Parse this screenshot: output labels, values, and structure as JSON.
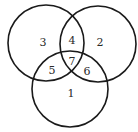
{
  "diagram": {
    "type": "venn",
    "circles": [
      {
        "id": "left",
        "cx": 46,
        "cy": 43,
        "r": 38
      },
      {
        "id": "right",
        "cx": 98,
        "cy": 44,
        "r": 38
      },
      {
        "id": "bottom",
        "cx": 70,
        "cy": 89,
        "r": 38
      }
    ],
    "regions": [
      {
        "label": "1",
        "x": 71,
        "y": 93
      },
      {
        "label": "2",
        "x": 100,
        "y": 42
      },
      {
        "label": "3",
        "x": 43,
        "y": 42
      },
      {
        "label": "4",
        "x": 72,
        "y": 40
      },
      {
        "label": "5",
        "x": 52,
        "y": 70
      },
      {
        "label": "6",
        "x": 87,
        "y": 71
      },
      {
        "label": "7",
        "x": 72,
        "y": 61
      }
    ],
    "stroke_color": "#1a1a1a",
    "background": "#ffffff"
  }
}
